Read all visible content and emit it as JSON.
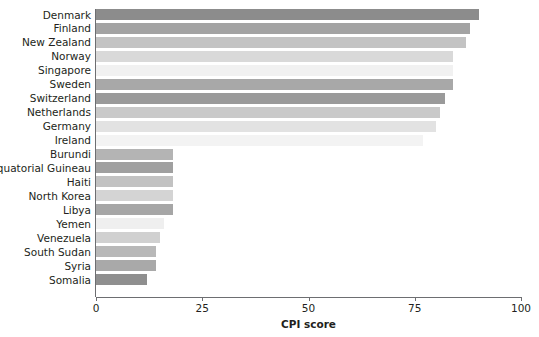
{
  "chart_data": {
    "type": "bar",
    "orientation": "horizontal",
    "title": "",
    "subtitle": "",
    "xlabel": "CPI score",
    "ylabel": "",
    "xlim": [
      0,
      100
    ],
    "xticks": [
      0,
      25,
      50,
      75,
      100
    ],
    "xtick_labels": [
      "0",
      "25",
      "50",
      "75",
      "100"
    ],
    "grid": false,
    "legend": "none",
    "categories": [
      "Denmark",
      "Finland",
      "New Zealand",
      "Norway",
      "Singapore",
      "Sweden",
      "Switzerland",
      "Netherlands",
      "Germany",
      "Ireland",
      "Burundi",
      "Equatorial Guineau",
      "Haiti",
      "North Korea",
      "Libya",
      "Yemen",
      "Venezuela",
      "South Sudan",
      "Syria",
      "Somalia"
    ],
    "values": [
      90,
      88,
      87,
      84,
      84,
      84,
      82,
      81,
      80,
      77,
      18,
      18,
      18,
      18,
      18,
      16,
      15,
      14,
      14,
      12
    ],
    "bar_colors": [
      "#8c8c8c",
      "#a3a3a3",
      "#c3c3c3",
      "#d9d9d9",
      "#f1f1f1",
      "#a8a8a8",
      "#9a9a9a",
      "#c9c9c9",
      "#e2e2e2",
      "#f3f3f3",
      "#b4b4b4",
      "#a0a0a0",
      "#c2c2c2",
      "#d4d4d4",
      "#a6a6a6",
      "#efefef",
      "#d0d0d0",
      "#b8b8b8",
      "#a9a9a9",
      "#8f8f8f"
    ],
    "axis_color": "#6d6e71"
  }
}
